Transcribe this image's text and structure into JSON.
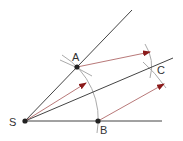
{
  "diagram": {
    "points": [
      {
        "id": "S",
        "label": "S",
        "x": 25,
        "y": 121
      },
      {
        "id": "A",
        "label": "A",
        "x": 77,
        "y": 67
      },
      {
        "id": "B",
        "label": "B",
        "x": 98,
        "y": 121
      },
      {
        "id": "C",
        "label": "C",
        "x": 152,
        "y": 67
      }
    ],
    "rays": [
      {
        "name": "ray-sa",
        "from": "S",
        "to": [
          132,
          10
        ]
      },
      {
        "name": "ray-sb",
        "from": "S",
        "to": [
          162,
          121
        ]
      },
      {
        "name": "bisector-ray",
        "from": "S",
        "to": [
          173,
          58
        ]
      }
    ],
    "vectors": [
      {
        "name": "vector-s",
        "from": [
          25,
          121
        ],
        "to": [
          86,
          83
        ]
      },
      {
        "name": "vector-a",
        "from": [
          77,
          67
        ],
        "to": [
          150,
          52
        ]
      },
      {
        "name": "vector-b",
        "from": [
          98,
          121
        ],
        "to": [
          164,
          84
        ]
      }
    ],
    "colors": {
      "line": "#444444",
      "vector": "#b06a6a",
      "arrowhead": "#8b1a1a",
      "arc": "#999999",
      "point": "#222222",
      "label": "#333333"
    }
  }
}
